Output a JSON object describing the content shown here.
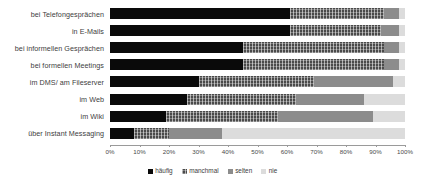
{
  "chart_data": {
    "type": "bar",
    "orientation": "horizontal",
    "stacked": true,
    "normalized_percent": true,
    "title": "",
    "subtitle": "",
    "xlabel": "",
    "ylabel": "",
    "xlim": [
      0,
      100
    ],
    "grid": false,
    "legend_position": "bottom",
    "categories": [
      "bei Telefongesprächen",
      "in E-Mails",
      "bei informellen Gesprächen",
      "bei formellen Meetings",
      "im DMS/ am Fileserver",
      "im Web",
      "im Wiki",
      "über Instant Messaging"
    ],
    "xticks": [
      "0%",
      "10%",
      "20%",
      "30%",
      "40%",
      "50%",
      "60%",
      "70%",
      "80%",
      "90%",
      "100%"
    ],
    "xtick_values": [
      0,
      10,
      20,
      30,
      40,
      50,
      60,
      70,
      80,
      90,
      100
    ],
    "series": [
      {
        "name": "häufig",
        "color": "#0a0a0a",
        "values": [
          61,
          61,
          45,
          45,
          30,
          26,
          19,
          8
        ]
      },
      {
        "name": "manchmal",
        "color": "#4a4a4a",
        "values": [
          32,
          31,
          48,
          48,
          39,
          37,
          38,
          12
        ]
      },
      {
        "name": "selten",
        "color": "#8c8c8c",
        "values": [
          5,
          6,
          5,
          5,
          27,
          23,
          32,
          18
        ]
      },
      {
        "name": "nie",
        "color": "#dcdcdc",
        "values": [
          2,
          2,
          2,
          2,
          4,
          14,
          11,
          62
        ]
      }
    ]
  },
  "legend": {
    "items": [
      {
        "label": "häufig"
      },
      {
        "label": "manchmal"
      },
      {
        "label": "selten"
      },
      {
        "label": "nie"
      }
    ]
  }
}
